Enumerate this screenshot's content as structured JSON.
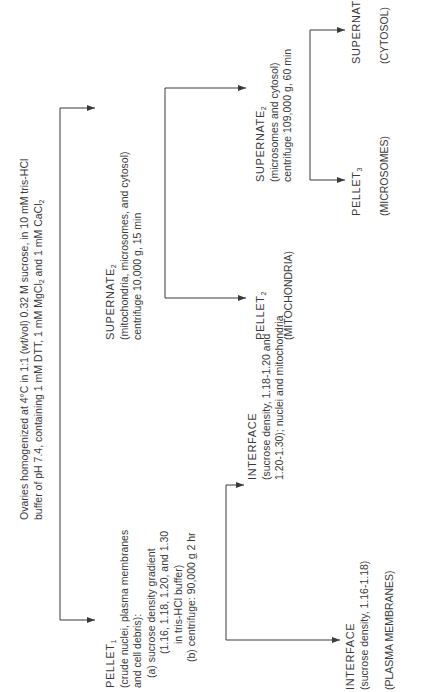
{
  "title": {
    "line1": "Ovaries homogenized at 4°C in 1:1 (wt/vol) 0.32 M sucrose, in 10 mM tris-HCl",
    "line2_pre": "buffer of pH 7.4, containing 1 mM DTT, 1 mM MgCl",
    "line2_sub1": "2",
    "line2_mid": " and 1 mM CaCl",
    "line2_sub2": "2"
  },
  "pellet1": {
    "label": "PELLET",
    "sub": "1",
    "desc1": "(crude nuclei, plasma membranes",
    "desc2": "and cell debris):",
    "step_a": "(a)  sucrose density gradient",
    "step_a2": "(1.16, 1.18, 1.20, and 1.30",
    "step_a3": "in tris-HCl buffer)",
    "step_b_pre": "(b)  centrifuge:  90,000 ",
    "step_b_g": "g",
    "step_b_post": " 2 hr"
  },
  "interface_upper": {
    "label": "INTERFACE",
    "desc1": "(sucrose density, 1.18-1.20 and",
    "desc2": "1.20-1.30); nuclei and mitochondria"
  },
  "interface_lower": {
    "label": "INTERFACE",
    "desc1": "(sucrose density, 1.16-1.18)",
    "result": "(PLASMA MEMBRANES)"
  },
  "supernate2": {
    "label": "SUPERNATE",
    "sub": "2",
    "desc1": "(mitochondria, microsomes, and cytosol)",
    "desc2_pre": "centrifuge 10,000 ",
    "desc2_g": "g",
    "desc2_post": ", 15 min"
  },
  "pellet2": {
    "label": "PELLET",
    "sub": "2",
    "result": "(MITOCHONDRIA)"
  },
  "supernate2b": {
    "label": "SUPERNATE",
    "sub": "2",
    "desc1": "(microsomes and cytosol)",
    "desc2_pre": "centrifuge 109,000 ",
    "desc2_g": "g",
    "desc2_post": ", 60 min"
  },
  "pellet3": {
    "label": "PELLET",
    "sub": "3",
    "result": "(MICROSOMES)"
  },
  "supernate3": {
    "label": "SUPERNATE",
    "sub": "3",
    "result": "(CYTOSOL)"
  },
  "colors": {
    "ink": "#3a3a3a",
    "background": "#ffffff"
  }
}
